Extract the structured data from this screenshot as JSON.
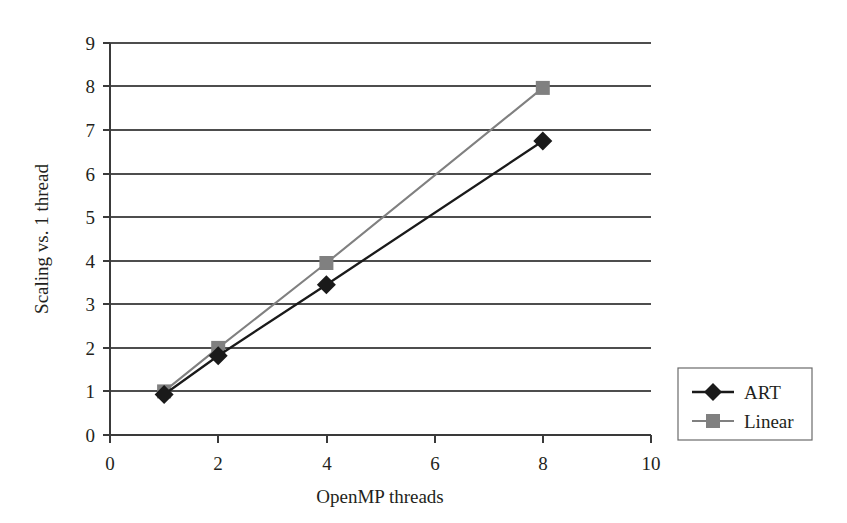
{
  "chart_data": {
    "type": "line",
    "title": "",
    "subtitle": "",
    "xlabel": "OpenMP threads",
    "ylabel": "Scaling vs. 1 thread",
    "xlim": [
      0,
      10
    ],
    "ylim": [
      0,
      9
    ],
    "xticks": [
      "0",
      "2",
      "4",
      "6",
      "8",
      "10"
    ],
    "xtick_values": [
      0,
      2,
      4,
      6,
      8,
      10
    ],
    "yticks": [
      "0",
      "1",
      "2",
      "3",
      "4",
      "5",
      "6",
      "7",
      "8",
      "9"
    ],
    "ytick_values": [
      0,
      1,
      2,
      3,
      4,
      5,
      6,
      7,
      8,
      9
    ],
    "grid": "horizontal",
    "legend_position": "right-outside",
    "x": [
      1,
      2,
      4,
      8
    ],
    "series": [
      {
        "name": "ART",
        "values": [
          0.93,
          1.82,
          3.45,
          6.75
        ],
        "color": "#1a1a1a",
        "marker": "diamond"
      },
      {
        "name": "Linear",
        "values": [
          1.0,
          2.0,
          3.95,
          7.97
        ],
        "color": "#808080",
        "marker": "square"
      }
    ]
  },
  "legend": {
    "entries": [
      {
        "label": "ART",
        "marker": "diamond-marker",
        "color": "#1a1a1a"
      },
      {
        "label": "Linear",
        "marker": "square-marker",
        "color": "#808080"
      }
    ]
  },
  "colors": {
    "background": "#ffffff",
    "text": "#231f20",
    "gridline": "#4d4d4d",
    "axis": "#3a3a3a",
    "series_art": "#1a1a1a",
    "series_linear": "#808080"
  }
}
